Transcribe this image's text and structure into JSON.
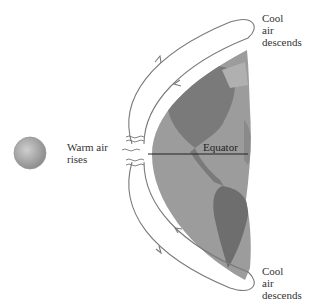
{
  "diagram": {
    "labels": {
      "cool_top": [
        "Cool",
        "air",
        "descends"
      ],
      "warm": [
        "Warm air",
        "rises"
      ],
      "equator": "Equator",
      "cool_bottom": [
        "Cool",
        "air",
        "descends"
      ]
    },
    "colors": {
      "arrow": "#7a7a7a",
      "ocean": "#9a9a9a",
      "land": "#7c7c7c",
      "sun": "#b0b0b0",
      "equator_line": "#222222"
    }
  }
}
